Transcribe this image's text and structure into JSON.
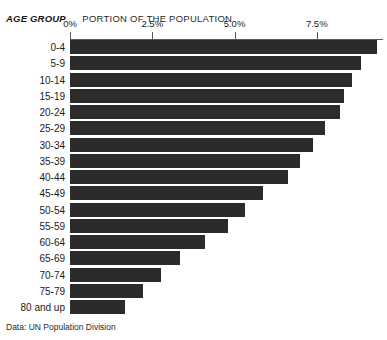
{
  "header": {
    "age_group_label": "AGE GROUP",
    "portion_label": "PORTION OF THE POPULATION"
  },
  "footer": {
    "source": "Data: UN Population Division"
  },
  "chart_data": {
    "type": "bar",
    "orientation": "horizontal",
    "title": "PORTION OF THE POPULATION",
    "xlabel": "PORTION OF THE POPULATION",
    "ylabel": "AGE GROUP",
    "grid": false,
    "legend": "none",
    "xlim": [
      0,
      9.5
    ],
    "xticks": [
      0,
      2.5,
      5.0,
      7.5
    ],
    "xtick_labels": [
      "0%",
      "2.5%",
      "5.0%",
      "7.5%"
    ],
    "bar_color": "#2b2b2b",
    "categories": [
      "0-4",
      "5-9",
      "10-14",
      "15-19",
      "20-24",
      "25-29",
      "30-34",
      "35-39",
      "40-44",
      "45-49",
      "50-54",
      "55-59",
      "60-64",
      "65-69",
      "70-74",
      "75-79",
      "80 and up"
    ],
    "values": [
      9.33,
      8.85,
      8.57,
      8.33,
      8.21,
      7.75,
      7.39,
      7.0,
      6.63,
      5.87,
      5.32,
      4.8,
      4.1,
      3.34,
      2.77,
      2.22,
      1.67
    ],
    "source": "Data: UN Population Division"
  }
}
